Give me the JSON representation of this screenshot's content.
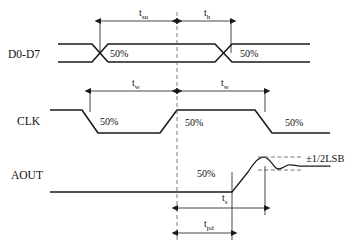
{
  "diagram": {
    "type": "timing-diagram",
    "background_color": "#ffffff",
    "line_color": "#1a1a1a",
    "dashed_color": "#5a5a5a",
    "signals": [
      {
        "id": "data_bus",
        "label": "D0-D7",
        "label_x": 8,
        "label_y": 58
      },
      {
        "id": "clock",
        "label": "CLK",
        "label_x": 17,
        "label_y": 125
      },
      {
        "id": "analog_out",
        "label": "AOUT",
        "label_x": 11,
        "label_y": 179
      }
    ],
    "percent_markers": [
      {
        "id": "data-cross-left",
        "text": "50%",
        "x": 110,
        "y": 57
      },
      {
        "id": "data-cross-right",
        "text": "50%",
        "x": 240,
        "y": 57
      },
      {
        "id": "clk-fall-left",
        "text": "50%",
        "x": 100,
        "y": 125
      },
      {
        "id": "clk-rise-mid",
        "text": "50%",
        "x": 185,
        "y": 126
      },
      {
        "id": "clk-fall-right",
        "text": "50%",
        "x": 285,
        "y": 126
      },
      {
        "id": "aout-rise",
        "text": "50%",
        "x": 197,
        "y": 177
      }
    ],
    "dimensions": [
      {
        "id": "t-su",
        "base": "t",
        "sub": "su",
        "label_x": 139,
        "label_y": 16,
        "from_x": 100,
        "to_x": 177,
        "y": 21
      },
      {
        "id": "t-h",
        "base": "t",
        "sub": "h",
        "label_x": 204,
        "label_y": 16,
        "from_x": 177,
        "to_x": 231,
        "y": 21
      },
      {
        "id": "t-w-left",
        "base": "t",
        "sub": "w",
        "label_x": 132,
        "label_y": 86,
        "from_x": 90,
        "to_x": 177,
        "y": 91
      },
      {
        "id": "t-w-right",
        "base": "t",
        "sub": "w",
        "label_x": 221,
        "label_y": 86,
        "from_x": 177,
        "to_x": 265,
        "y": 91
      },
      {
        "id": "t-s",
        "base": "t",
        "sub": "s",
        "label_x": 222,
        "label_y": 201,
        "from_x": 177,
        "to_x": 265,
        "y": 208
      },
      {
        "id": "t-pd",
        "base": "t",
        "sub": "pd",
        "label_x": 204,
        "label_y": 227,
        "from_x": 177,
        "to_x": 232,
        "y": 233
      }
    ],
    "annotations": [
      {
        "id": "lsb-tolerance",
        "text": "±1/2LSB",
        "x": 306,
        "y": 162
      }
    ],
    "center_reference": {
      "id": "clock-edge-reference",
      "x": 177,
      "y_top": 12,
      "y_bottom": 243
    },
    "tolerance_band": {
      "upper_y": 157,
      "lower_y": 170,
      "from_x": 258,
      "to_x": 300
    }
  }
}
